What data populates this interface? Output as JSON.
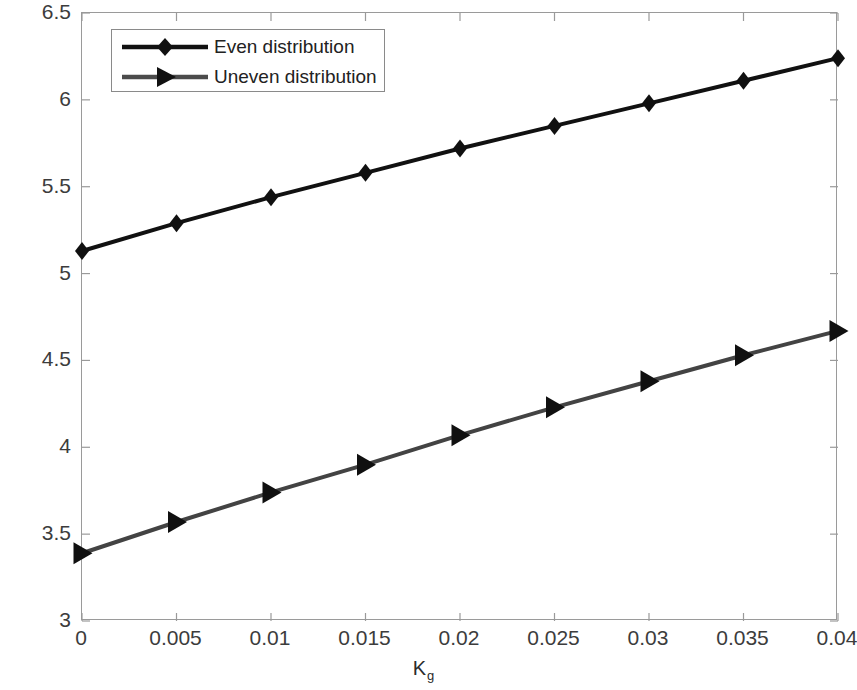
{
  "chart_data": {
    "type": "line",
    "title": "",
    "xlabel": "K_g",
    "xlabel_base": "K",
    "xlabel_sub": "g",
    "ylabel": "Dimensionless Frequency of the Nano-Beam",
    "xlim": [
      0,
      0.04
    ],
    "ylim": [
      3,
      6.5
    ],
    "xticks": [
      0,
      0.005,
      0.01,
      0.015,
      0.02,
      0.025,
      0.03,
      0.035,
      0.04
    ],
    "xtick_labels": [
      "0",
      "0.005",
      "0.01",
      "0.015",
      "0.02",
      "0.025",
      "0.03",
      "0.035",
      "0.04"
    ],
    "yticks": [
      3,
      3.5,
      4,
      4.5,
      5,
      5.5,
      6,
      6.5
    ],
    "ytick_labels": [
      "3",
      "3.5",
      "4",
      "4.5",
      "5",
      "5.5",
      "6",
      "6.5"
    ],
    "grid": false,
    "legend_position": "upper left",
    "x": [
      0,
      0.005,
      0.01,
      0.015,
      0.02,
      0.025,
      0.03,
      0.035,
      0.04
    ],
    "series": [
      {
        "name": "Even distribution",
        "marker": "diamond",
        "color": "#111111",
        "line_width": 4,
        "values": [
          5.13,
          5.29,
          5.44,
          5.58,
          5.72,
          5.85,
          5.98,
          6.11,
          6.24
        ]
      },
      {
        "name": "Uneven distribution",
        "marker": "right-triangle",
        "color": "#434343",
        "line_width": 4,
        "values": [
          3.39,
          3.57,
          3.74,
          3.9,
          4.07,
          4.23,
          4.38,
          4.53,
          4.67
        ]
      }
    ]
  },
  "axes": {
    "frame_color": "#9a9a9a",
    "background": "#ffffff"
  }
}
